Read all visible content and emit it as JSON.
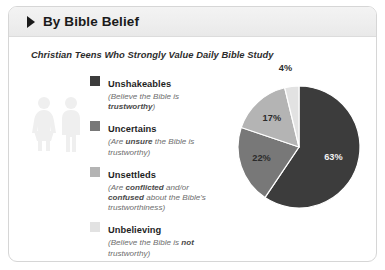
{
  "header": {
    "arrow_icon": "triangle-right-icon",
    "title": "By Bible Belief"
  },
  "chart_title": "Christian Teens Who Strongly Value Daily Bible Study",
  "watermark": {
    "icon": "two-people-icon",
    "color": "#efefef"
  },
  "legend": {
    "items": [
      {
        "label": "Unshakeables",
        "desc_prefix": "(Believe the Bible is ",
        "desc_emphasis": "trustworthy",
        "desc_suffix": ")",
        "color": "#3c3c3c"
      },
      {
        "label": "Uncertains",
        "desc_prefix": "(Are ",
        "desc_emphasis": "unsure",
        "desc_suffix": " the Bible is trustworthy)",
        "color": "#787878"
      },
      {
        "label": "Unsettleds",
        "desc_prefix": "(Are ",
        "desc_emphasis": "conflicted",
        "desc_mid": " and/or ",
        "desc_emphasis2": "confused",
        "desc_suffix": " about the Bible's trustworthiness)",
        "color": "#b4b4b4"
      },
      {
        "label": "Unbelieving",
        "desc_prefix": "(Believe the Bible is ",
        "desc_emphasis": "not",
        "desc_suffix": " trustworthy)",
        "color": "#e2e2e2"
      }
    ]
  },
  "chart_data": {
    "type": "pie",
    "title": "Christian Teens Who Strongly Value Daily Bible Study",
    "categories": [
      "Unshakeables",
      "Uncertains",
      "Unsettleds",
      "Unbelieving"
    ],
    "values": [
      63,
      22,
      17,
      4
    ],
    "value_labels": [
      "63%",
      "22%",
      "17%",
      "4%"
    ],
    "colors": [
      "#3c3c3c",
      "#787878",
      "#b4b4b4",
      "#e2e2e2"
    ],
    "legend_position": "left",
    "grid": false,
    "start_angle_deg": 0,
    "direction": "clockwise",
    "units": "percent"
  }
}
